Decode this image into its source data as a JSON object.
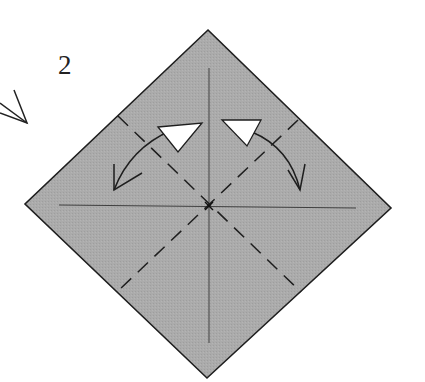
{
  "diagram": {
    "type": "origami-step",
    "step_number": "2",
    "paper": {
      "shape": "square-diamond",
      "fill": "#a9a9a9",
      "edge": "#1e1e1e",
      "corners": {
        "top": [
          208,
          30
        ],
        "right": [
          391,
          208
        ],
        "bottom": [
          207,
          378
        ],
        "left": [
          25,
          204
        ]
      }
    },
    "creases": [
      {
        "name": "vertical-crease",
        "style": "thin-solid",
        "from": [
          209,
          68
        ],
        "to": [
          209,
          343
        ]
      },
      {
        "name": "horizontal-crease",
        "style": "thin-solid",
        "from": [
          59,
          205
        ],
        "to": [
          356,
          208
        ]
      }
    ],
    "valley_folds": [
      {
        "name": "diagonal-valley-fold-1",
        "style": "dashed",
        "from": [
          118,
          116
        ],
        "to": [
          301,
          292
        ]
      },
      {
        "name": "diagonal-valley-fold-2",
        "style": "dashed",
        "from": [
          298,
          120
        ],
        "to": [
          118,
          291
        ]
      }
    ],
    "arrows": [
      {
        "name": "fold-unfold-arrow-left",
        "kind": "fold-and-unfold",
        "from": [
          114,
          190
        ],
        "to": [
          200,
          124
        ]
      },
      {
        "name": "fold-unfold-arrow-right",
        "kind": "fold-and-unfold",
        "from": [
          300,
          190
        ],
        "to": [
          222,
          124
        ]
      }
    ],
    "previous_step_arrow": {
      "name": "partial-arrowhead",
      "position": [
        0,
        90
      ]
    },
    "center_mark": [
      209,
      206
    ]
  }
}
